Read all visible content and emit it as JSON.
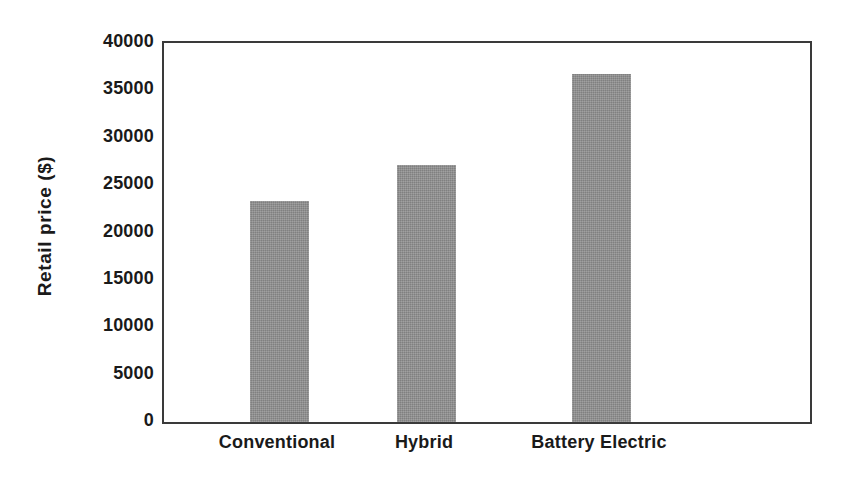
{
  "chart_data": {
    "type": "bar",
    "title": "",
    "subtitle": "",
    "xlabel": "",
    "ylabel": "Retail price  ($)",
    "categories": [
      "Conventional",
      "Hybrid",
      "Battery Electric"
    ],
    "values": [
      23300,
      27100,
      36700
    ],
    "ylim": [
      0,
      40000
    ],
    "ytick_labels": [
      "0",
      "5000",
      "10000",
      "15000",
      "20000",
      "25000",
      "30000",
      "35000",
      "40000"
    ],
    "ytick_values": [
      0,
      5000,
      10000,
      15000,
      20000,
      25000,
      30000,
      35000,
      40000
    ],
    "grid": false,
    "legend": false,
    "legend_position": "none",
    "bar_color": "#8c8c8c",
    "axis_color": "#3a3a3a",
    "text_color": "#1a1a1a",
    "background_color": "#ffffff",
    "series": [
      {
        "name": "Retail price",
        "values": [
          23300,
          27100,
          36700
        ]
      }
    ]
  }
}
